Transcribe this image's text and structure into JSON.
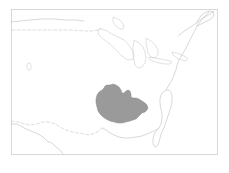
{
  "figure": {
    "type": "thematic-map",
    "title": "",
    "caption": "",
    "width": 229,
    "height": 173,
    "background_color": "#ffffff",
    "region_depicted": "Continental United States",
    "projection_hint": "conic"
  },
  "frame": {
    "name": "map-border",
    "stroke_color": "#d8d8d8",
    "x": 11,
    "y": 9,
    "width": 207,
    "height": 146
  },
  "layers": {
    "coastline": {
      "label": "coastline",
      "stroke_color": "#c9c9c9"
    },
    "international_border": {
      "label": "international border",
      "stroke_color": "#cfcfcf",
      "style": "dashed"
    },
    "great_lakes": {
      "label": "Great Lakes",
      "stroke_color": "#cccccc"
    },
    "inland_lake": {
      "label": "Great Salt Lake",
      "stroke_color": "#d2d2d2"
    },
    "highlight": {
      "label": "highlighted region",
      "fill_color": "#9a9a9a",
      "stroke_color": "#8d8d8d",
      "approx_area_center": "South Central United States"
    }
  },
  "geometry": {
    "pacific_and_mexico_west": "M 11 124 L 17 124 L 24 128 L 31 131 L 38 134 L 43 137 L 47 141 L 52 143 L 56 147 L 60 150 L 63 154 L 64 155",
    "mexico_border_dashed": "M 11 121 L 18 122 L 25 124 L 31 125 L 37 124 L 43 122 L 49 122 L 55 124 L 60 127 L 66 130 L 72 132 L 78 133 L 84 134 L 90 135 L 95 133 L 99 131 L 102 128",
    "canada_border_dashed": "M 12 30 L 24 30 L 36 30 L 48 30 L 60 30 L 72 30 L 84 31 L 92 31 L 98 30 L 101 28",
    "northwest_coast_top": "M 11 22 L 20 21 L 30 20 L 42 19 L 54 19 L 66 20 L 76 20 L 84 21",
    "gulf_coast": "M 102 128 L 106 130 L 110 133 L 114 135 L 119 137 L 124 138 L 130 138 L 136 137 L 142 136 L 147 134 L 152 132 L 156 130 L 159 128",
    "florida": "M 159 128 L 161 124 L 162 119 L 162 114 L 161 109 L 160 104 L 160 99 L 161 95 L 163 92 L 166 90 L 169 90 L 171 92 L 172 96 L 172 101 L 171 107 L 169 113 L 167 119 L 165 125 L 163 130 L 161 134 L 160 138 L 159 142 L 158 145 L 156 147 L 154 146 L 153 143 L 153 139 L 154 135 L 156 131 L 158 129",
    "atlantic_coast": "M 166 90 L 169 85 L 172 80 L 174 75 L 176 70 L 177 65 L 179 60 L 182 55 L 185 50 L 187 46 L 189 42 L 191 38 L 193 34 L 195 30 L 197 26 L 200 22 L 203 18 L 206 15 L 209 12",
    "northeast_detail": "M 197 26 L 201 24 L 205 22 L 209 20 L 212 18 L 214 15 L 213 12 L 210 11 L 206 12 L 203 14 L 200 17 L 198 20 L 197 23",
    "st_lawrence": "M 178 36 L 183 32 L 189 28 L 195 24 L 200 20 L 205 17 L 210 14 L 214 11",
    "great_lakes_paths": [
      "M 102 29 L 107 31 L 112 34 L 118 37 L 124 40 L 128 44 L 131 48 L 133 52 L 134 56 L 133 59 L 130 60 L 126 59 L 122 56 L 118 52 L 114 48 L 110 44 L 106 41 L 102 38 L 99 35 L 98 32 L 99 29 Z",
      "M 134 40 L 139 43 L 143 47 L 145 52 L 146 58 L 145 63 L 142 67 L 138 68 L 135 65 L 134 60 L 133 54 L 133 47 Z",
      "M 146 38 L 151 41 L 155 45 L 158 50 L 158 55 L 155 58 L 151 57 L 148 53 L 147 48 L 146 43 Z",
      "M 149 57 L 155 58 L 161 59 L 166 60 L 170 61 L 172 62 L 170 64 L 165 64 L 159 63 L 153 61 L 149 59 Z",
      "M 172 52 L 177 53 L 182 55 L 186 57 L 188 59 L 186 61 L 182 60 L 177 58 L 173 55 Z",
      "M 113 17 L 118 19 L 122 22 L 124 26 L 123 29 L 120 29 L 116 26 L 113 22 Z"
    ],
    "salt_lake": "M 28 63 L 30 63 L 31 65 L 31 68 L 30 70 L 28 70 L 27 68 L 27 65 Z",
    "highlight_polygon": "M 110 85 L 113 84 L 116 85 L 119 87 L 121 90 L 122 93 L 124 93 L 126 91 L 128 90 L 130 91 L 131 94 L 131 97 L 133 98 L 136 98 L 139 99 L 142 101 L 145 103 L 147 105 L 148 108 L 147 110 L 145 112 L 142 113 L 140 115 L 138 117 L 136 119 L 133 120 L 130 121 L 126 122 L 122 123 L 118 123 L 114 122 L 110 121 L 106 119 L 103 117 L 100 114 L 98 111 L 97 107 L 96 103 L 96 99 L 97 95 L 99 92 L 102 90 L 104 88 L 105 86 L 107 85 Z"
  }
}
